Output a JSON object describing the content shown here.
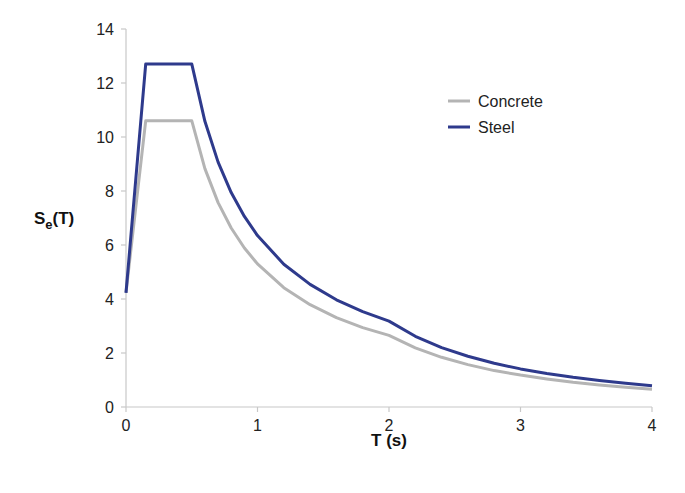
{
  "chart_data": {
    "type": "line",
    "title": "",
    "xlabel": "T (s)",
    "ylabel_main": "S",
    "ylabel_sub": "e",
    "ylabel_tail": "(T)",
    "xlim": [
      0,
      4
    ],
    "ylim": [
      0,
      14
    ],
    "xticks": [
      0,
      1,
      2,
      3,
      4
    ],
    "yticks": [
      0,
      2,
      4,
      6,
      8,
      10,
      12,
      14
    ],
    "grid": false,
    "legend_position": "upper right",
    "series": [
      {
        "name": "Concrete",
        "color": "#b4b4b4",
        "x": [
          0,
          0.15,
          0.5,
          0.6,
          0.7,
          0.8,
          0.9,
          1.0,
          1.2,
          1.4,
          1.6,
          1.8,
          2.0,
          2.2,
          2.4,
          2.6,
          2.8,
          3.0,
          3.2,
          3.4,
          3.6,
          3.8,
          4.0
        ],
        "values": [
          4.24,
          10.6,
          10.6,
          8.83,
          7.57,
          6.63,
          5.89,
          5.3,
          4.42,
          3.79,
          3.31,
          2.94,
          2.65,
          2.19,
          1.84,
          1.57,
          1.35,
          1.18,
          1.04,
          0.92,
          0.82,
          0.73,
          0.66
        ]
      },
      {
        "name": "Steel",
        "color": "#2e3a8c",
        "x": [
          0,
          0.15,
          0.5,
          0.6,
          0.7,
          0.8,
          0.9,
          1.0,
          1.2,
          1.4,
          1.6,
          1.8,
          2.0,
          2.2,
          2.4,
          2.6,
          2.8,
          3.0,
          3.2,
          3.4,
          3.6,
          3.8,
          4.0
        ],
        "values": [
          4.23,
          12.7,
          12.7,
          10.58,
          9.07,
          7.94,
          7.06,
          6.35,
          5.29,
          4.54,
          3.97,
          3.53,
          3.18,
          2.62,
          2.2,
          1.88,
          1.62,
          1.41,
          1.24,
          1.1,
          0.98,
          0.88,
          0.79
        ]
      }
    ]
  }
}
